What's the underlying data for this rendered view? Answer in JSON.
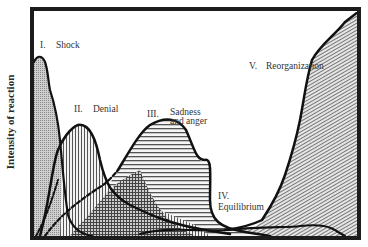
{
  "figure": {
    "y_axis_label": "Intensity of reaction",
    "x_axis_label": "",
    "colors": {
      "frame": "#1c1c1c",
      "outline": "#111111",
      "background": "#ffffff",
      "text": "#333333",
      "fill_shock": "#bdbdbd",
      "fill_hatch": "#555555"
    },
    "stages": [
      {
        "numeral": "I.",
        "label": "Shock",
        "pattern": "fine-stipple"
      },
      {
        "numeral": "II.",
        "label": "Denial",
        "pattern": "vertical-lines"
      },
      {
        "numeral": "III.",
        "label_line1": "Sadness",
        "label_line2": "and anger",
        "pattern": "horizontal-lines"
      },
      {
        "numeral": "IV.",
        "label": "Equilibrium",
        "pattern": "diagonal-lines-low"
      },
      {
        "numeral": "V.",
        "label": "Reorganization",
        "pattern": "diagonal-lines"
      }
    ]
  }
}
